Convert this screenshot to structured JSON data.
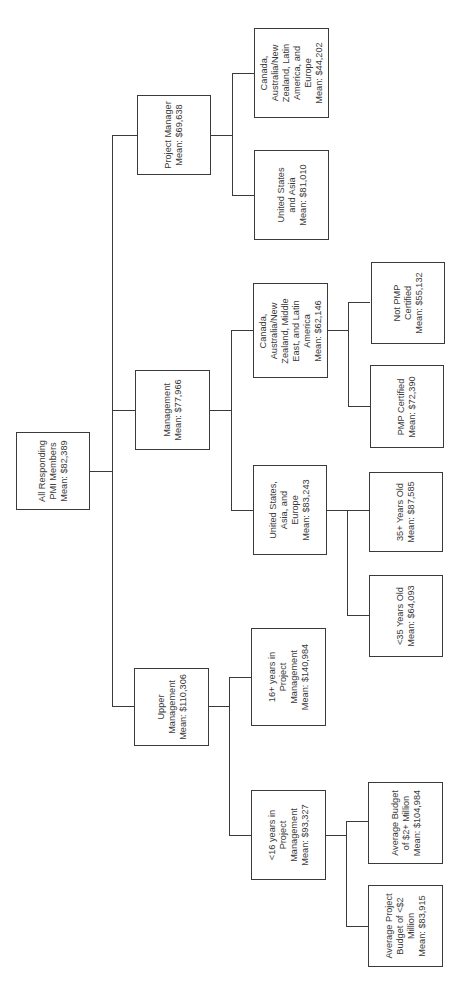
{
  "diagram": {
    "type": "tree",
    "orientation": "rotated-90-ccw",
    "root": {
      "label": "All Responding\nPMI Members\nMean: $82,389"
    },
    "level1": [
      {
        "label": "Project Manager\nMean: $69,638"
      },
      {
        "label": "Management\nMean: $77,966"
      },
      {
        "label": "Upper\nManagement\nMean: $110,306"
      }
    ],
    "level2": [
      {
        "label": "Canada,\nAustralia/New\nZealand, Latin\nAmerica, and\nEurope\nMean: $44,202"
      },
      {
        "label": "United States\nand Asia\nMean: $81,010"
      },
      {
        "label": "Canada,\nAustralia/New\nZealand, Middle\nEast, and Latin\nAmerica\nMean: $62,146"
      },
      {
        "label": "United States,\nAsia, and\nEurope\nMean: $83,243"
      },
      {
        "label": "16+ years in\nProject\nManagement\nMean: $140,984"
      },
      {
        "label": "<16 years in\nProject\nManagement\nMean: $93,327"
      }
    ],
    "level3": [
      {
        "label": "Not PMP\nCertified\nMean: $55,132"
      },
      {
        "label": "PMP Certified\nMean: $72,390"
      },
      {
        "label": "35+ Years Old\nMean: $87,585"
      },
      {
        "label": "<35 Years Old\nMean: $64,093"
      },
      {
        "label": "Average Budget\nof $2+ Million\nMean: $104,984"
      },
      {
        "label": "Average Project\nBudget of <$2\nMillion\nMean: $83,915"
      }
    ]
  }
}
